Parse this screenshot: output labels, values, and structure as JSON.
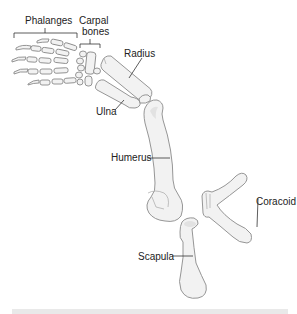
{
  "diagram": {
    "labels": {
      "phalanges": "Phalanges",
      "carpal_line1": "Carpal",
      "carpal_line2": "bones",
      "radius": "Radius",
      "ulna": "Ulna",
      "humerus": "Humerus",
      "coracoid": "Coracoid",
      "scapula": "Scapula"
    },
    "colors": {
      "background": "#ffffff",
      "bone_fill": "#f2f2f2",
      "bone_outline": "#8a8a8a",
      "label_text": "#222222",
      "footer_band": "#e9e9e9"
    }
  }
}
